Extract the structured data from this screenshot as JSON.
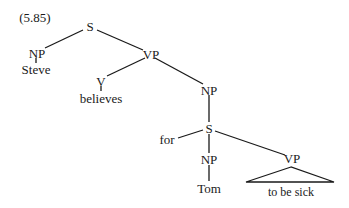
{
  "example_number": "(5.85)",
  "nodes": {
    "s_root": "S",
    "np_subj": "NP",
    "steve": "Steve",
    "vp_main": "VP",
    "v": "V",
    "believes": "believes",
    "np_obj": "NP",
    "s_embedded": "S",
    "for": "for",
    "np_embedded": "NP",
    "tom": "Tom",
    "vp_embedded": "VP",
    "to_be_sick": "to be sick"
  },
  "colors": {
    "line": "#1a1a1a",
    "text": "#1a1a1a",
    "background": "#ffffff"
  }
}
